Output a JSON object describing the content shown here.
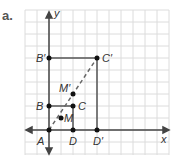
{
  "part_label": "a.",
  "axes": {
    "x_label": "x",
    "y_label": "y"
  },
  "grid": {
    "cell_px": 12,
    "cols": 12,
    "rows": 12
  },
  "points": [
    {
      "name": "A",
      "x": 0,
      "y": 0
    },
    {
      "name": "B",
      "x": 0,
      "y": 2
    },
    {
      "name": "C",
      "x": 2,
      "y": 2
    },
    {
      "name": "D",
      "x": 2,
      "y": 0
    },
    {
      "name": "M",
      "x": 1,
      "y": 1
    },
    {
      "name": "B'",
      "x": 0,
      "y": 6
    },
    {
      "name": "C'",
      "x": 4,
      "y": 6
    },
    {
      "name": "D'",
      "x": 4,
      "y": 0
    },
    {
      "name": "M'",
      "x": 2,
      "y": 3
    }
  ],
  "labels": {
    "A": "A",
    "B": "B",
    "C": "C",
    "D": "D",
    "M": "M",
    "Bp": "B′",
    "Cp": "C′",
    "Dp": "D′",
    "Mp": "M′"
  },
  "colors": {
    "grid": "#dcdcdc",
    "line": "#444444",
    "dash": "#666666"
  }
}
